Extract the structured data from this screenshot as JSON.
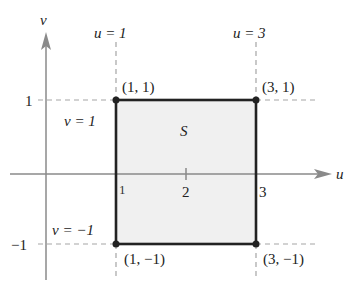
{
  "diagram": {
    "axes": {
      "horizontal_label": "u",
      "vertical_label": "v",
      "color": "#8a8a8a"
    },
    "region": {
      "label": "S",
      "fill": "#f0f0f0",
      "stroke": "#222222",
      "u_range": [
        1,
        3
      ],
      "v_range": [
        -1,
        1
      ]
    },
    "guide_lines": {
      "u1": "u = 1",
      "u3": "u = 3",
      "v1": "v = 1",
      "vm1": "v = −1",
      "color": "#a5a5a5"
    },
    "ticks": {
      "u": [
        "1",
        "2",
        "3"
      ],
      "v": [
        "1",
        "−1"
      ]
    },
    "vertices": [
      {
        "label": "(1, 1)"
      },
      {
        "label": "(3, 1)"
      },
      {
        "label": "(1, −1)"
      },
      {
        "label": "(3, −1)"
      }
    ]
  }
}
